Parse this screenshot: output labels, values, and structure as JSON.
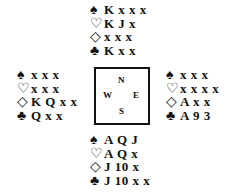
{
  "suits": {
    "spades": "♠",
    "hearts": "♡",
    "diamonds": "◇",
    "clubs": "♣"
  },
  "compass": {
    "north": "N",
    "west": "W",
    "east": "E",
    "south": "S"
  },
  "hands": {
    "north": {
      "spades": "K x x x",
      "hearts": "K J x",
      "diamonds": "x x x",
      "clubs": "K x x"
    },
    "west": {
      "spades": "x x x",
      "hearts": "x x x",
      "diamonds": "K Q x x",
      "clubs": "Q x x"
    },
    "east": {
      "spades": "x x x",
      "hearts": "x x x x",
      "diamonds": "A x x",
      "clubs": "A 9 3"
    },
    "south": {
      "spades": "A Q J",
      "hearts": "A Q x",
      "diamonds": "J 10 x",
      "clubs": "J 10 x x"
    }
  }
}
